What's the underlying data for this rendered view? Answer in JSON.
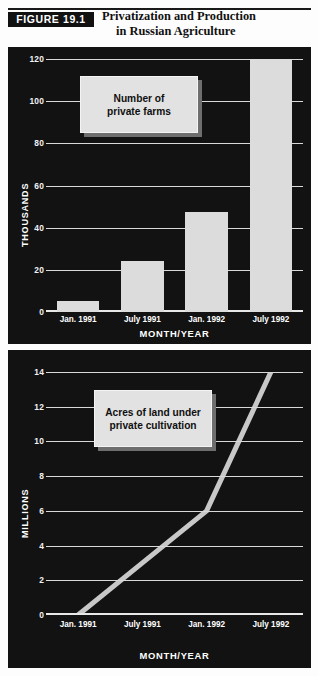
{
  "header": {
    "figure_badge": "FIGURE 19.1",
    "title_line1": "Privatization and Production",
    "title_line2": "in Russian Agriculture"
  },
  "chart_data": [
    {
      "type": "bar",
      "title": "Number of private farms",
      "legend_line1": "Number of",
      "legend_line2": "private farms",
      "categories": [
        "Jan. 1991",
        "July 1991",
        "Jan. 1992",
        "July 1992"
      ],
      "values": [
        5,
        24,
        47.5,
        122
      ],
      "xlabel": "MONTH/YEAR",
      "ylabel": "THOUSANDS",
      "yticks": [
        0,
        20,
        40,
        60,
        80,
        100,
        120
      ],
      "ylim": [
        0,
        120
      ],
      "grid": true,
      "legend_position": "inside-top-left",
      "bar_color": "#dcdcdc",
      "background_color": "#121212"
    },
    {
      "type": "line",
      "title": "Acres of land under private cultivation",
      "legend_line1": "Acres of land under",
      "legend_line2": "private cultivation",
      "categories": [
        "Jan. 1991",
        "July 1991",
        "Jan. 1992",
        "July 1992"
      ],
      "values": [
        0,
        3,
        6,
        14
      ],
      "xlabel": "MONTH/YEAR",
      "ylabel": "MILLIONS",
      "yticks": [
        0,
        2,
        4,
        6,
        8,
        10,
        12,
        14
      ],
      "ylim": [
        0,
        14
      ],
      "grid": true,
      "legend_position": "inside-top-left",
      "line_color": "#c8c8c8",
      "background_color": "#121212"
    }
  ]
}
